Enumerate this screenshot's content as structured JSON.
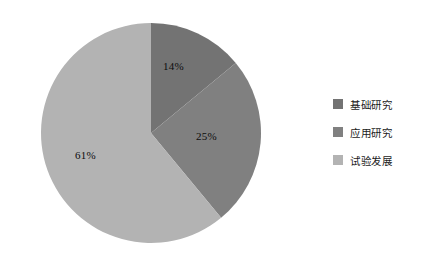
{
  "chart_data": {
    "type": "pie",
    "title": "",
    "categories": [
      "基础研究",
      "应用研究",
      "试验发展"
    ],
    "values": [
      14,
      25,
      61
    ],
    "value_labels": [
      "14%",
      "25%",
      "61%"
    ],
    "unit": "%",
    "start_angle_deg": 0,
    "direction": "clockwise",
    "legend_position": "right",
    "grid": false,
    "colors": [
      "#737373",
      "#808080",
      "#b3b3b3"
    ],
    "background": "#ffffff",
    "slices": [
      {
        "label": "基础研究",
        "value": 14,
        "value_label": "14%",
        "color": "#737373"
      },
      {
        "label": "应用研究",
        "value": 25,
        "value_label": "25%",
        "color": "#808080"
      },
      {
        "label": "试验发展",
        "value": 61,
        "value_label": "61%",
        "color": "#b3b3b3"
      }
    ]
  },
  "legend": {
    "items": [
      {
        "label": "基础研究",
        "color": "#737373"
      },
      {
        "label": "应用研究",
        "color": "#808080"
      },
      {
        "label": "试验发展",
        "color": "#b3b3b3"
      }
    ]
  }
}
